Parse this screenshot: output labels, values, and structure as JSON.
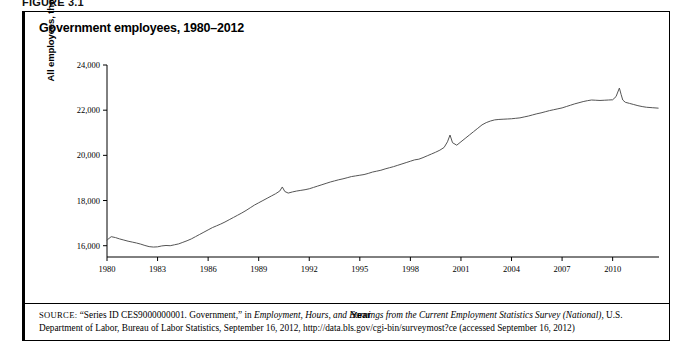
{
  "figure": {
    "label": "FIGURE 3.1",
    "panel_title": "Government employees, 1980–2012"
  },
  "axes": {
    "x_title": "Year",
    "y_title": "All employees, thousands",
    "y_ticks": [
      "24,000",
      "22,000",
      "20,000",
      "18,000",
      "16,000"
    ],
    "x_ticks": [
      "1980",
      "1983",
      "1986",
      "1989",
      "1992",
      "1995",
      "1998",
      "2001",
      "2004",
      "2007",
      "2010"
    ]
  },
  "source": {
    "label": "SOURCE:",
    "text_part1": "“Series ID CES9000000001. Government,” in ",
    "italic1": "Employment, Hours, and Earnings from the Current Employment Statistics Survey (National),",
    "text_part2": " U.S. Department of Labor, Bureau of Labor Statistics, September 16, 2012, http://data.bls.gov/cgi-bin/surveymost?ce (accessed September 16, 2012)"
  },
  "colors": {
    "line": "#555555",
    "axis": "#000000",
    "background": "#ffffff"
  },
  "chart_data": {
    "type": "line",
    "title": "Government employees, 1980–2012",
    "xlabel": "Year",
    "ylabel": "All employees, thousands",
    "xlim": [
      1980,
      2012.75
    ],
    "ylim": [
      15500,
      24000
    ],
    "grid": false,
    "legend": null,
    "series_name": "All government employees",
    "units": "thousands",
    "x": [
      1980.0,
      1980.25,
      1980.5,
      1980.75,
      1981.0,
      1981.25,
      1981.5,
      1981.75,
      1982.0,
      1982.25,
      1982.5,
      1982.75,
      1983.0,
      1983.25,
      1983.5,
      1983.75,
      1984.0,
      1984.25,
      1984.5,
      1984.75,
      1985.0,
      1985.25,
      1985.5,
      1985.75,
      1986.0,
      1986.25,
      1986.5,
      1986.75,
      1987.0,
      1987.25,
      1987.5,
      1987.75,
      1988.0,
      1988.25,
      1988.5,
      1988.75,
      1989.0,
      1989.25,
      1989.5,
      1989.75,
      1990.0,
      1990.25,
      1990.4,
      1990.55,
      1990.75,
      1991.0,
      1991.25,
      1991.5,
      1991.75,
      1992.0,
      1992.25,
      1992.5,
      1992.75,
      1993.0,
      1993.25,
      1993.5,
      1993.75,
      1994.0,
      1994.25,
      1994.5,
      1994.75,
      1995.0,
      1995.25,
      1995.5,
      1995.75,
      1996.0,
      1996.25,
      1996.5,
      1996.75,
      1997.0,
      1997.25,
      1997.5,
      1997.75,
      1998.0,
      1998.25,
      1998.5,
      1998.75,
      1999.0,
      1999.25,
      1999.5,
      1999.75,
      2000.0,
      2000.2,
      2000.35,
      2000.5,
      2000.75,
      2001.0,
      2001.25,
      2001.5,
      2001.75,
      2002.0,
      2002.25,
      2002.5,
      2002.75,
      2003.0,
      2003.25,
      2003.5,
      2003.75,
      2004.0,
      2004.25,
      2004.5,
      2004.75,
      2005.0,
      2005.25,
      2005.5,
      2005.75,
      2006.0,
      2006.25,
      2006.5,
      2006.75,
      2007.0,
      2007.25,
      2007.5,
      2007.75,
      2008.0,
      2008.25,
      2008.5,
      2008.75,
      2009.0,
      2009.25,
      2009.5,
      2009.75,
      2010.0,
      2010.2,
      2010.4,
      2010.5,
      2010.6,
      2010.75,
      2011.0,
      2011.25,
      2011.5,
      2011.75,
      2012.0,
      2012.35,
      2012.7
    ],
    "y": [
      16250,
      16400,
      16360,
      16300,
      16250,
      16200,
      16160,
      16120,
      16070,
      16010,
      15960,
      15940,
      15950,
      15990,
      16010,
      16000,
      16040,
      16080,
      16150,
      16220,
      16300,
      16400,
      16500,
      16600,
      16700,
      16800,
      16880,
      16960,
      17050,
      17150,
      17250,
      17350,
      17450,
      17560,
      17680,
      17800,
      17900,
      18000,
      18100,
      18200,
      18300,
      18420,
      18600,
      18400,
      18330,
      18380,
      18420,
      18450,
      18480,
      18520,
      18580,
      18640,
      18700,
      18760,
      18820,
      18870,
      18920,
      18960,
      19010,
      19060,
      19090,
      19120,
      19150,
      19200,
      19260,
      19300,
      19340,
      19400,
      19450,
      19500,
      19560,
      19620,
      19680,
      19740,
      19800,
      19830,
      19900,
      19980,
      20060,
      20140,
      20230,
      20350,
      20600,
      20900,
      20560,
      20450,
      20600,
      20750,
      20900,
      21050,
      21200,
      21350,
      21450,
      21520,
      21570,
      21590,
      21600,
      21610,
      21620,
      21640,
      21660,
      21700,
      21740,
      21790,
      21840,
      21880,
      21930,
      21980,
      22020,
      22060,
      22100,
      22160,
      22220,
      22280,
      22330,
      22380,
      22420,
      22450,
      22440,
      22430,
      22440,
      22450,
      22460,
      22600,
      22980,
      22700,
      22450,
      22350,
      22300,
      22250,
      22200,
      22160,
      22130,
      22110,
      22090
    ]
  }
}
